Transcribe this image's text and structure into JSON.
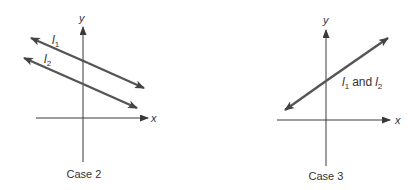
{
  "panels": [
    {
      "id": "case2",
      "caption": "Case 2",
      "axes": {
        "x_label": "x",
        "y_label": "y"
      },
      "lines": [
        {
          "name": "l",
          "subscript": "1"
        },
        {
          "name": "l",
          "subscript": "2"
        }
      ],
      "description": "Two parallel lines with negative slope, distinct y-intercepts"
    },
    {
      "id": "case3",
      "caption": "Case 3",
      "axes": {
        "x_label": "x",
        "y_label": "y"
      },
      "lines": [
        {
          "name": "l",
          "subscript": "1"
        },
        {
          "name": "l",
          "subscript": "2"
        }
      ],
      "joiner": "and",
      "description": "Coincident lines with positive slope"
    }
  ],
  "colors": {
    "axis": "#3a3a3a",
    "line": "#555555",
    "text": "#333333",
    "background": "#ffffff"
  }
}
